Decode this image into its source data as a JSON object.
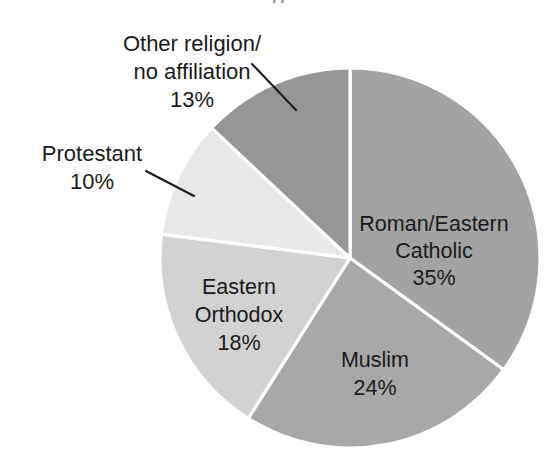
{
  "figure": {
    "background_color": "#ffffff",
    "cropped_title_fragment": "g",
    "center_x": 350,
    "center_y": 258,
    "radius": 190
  },
  "chart_data": {
    "type": "pie",
    "title": "",
    "xlabel": "",
    "ylabel": "",
    "units": "percent",
    "start_angle_deg": 0,
    "direction": "clockwise",
    "legend": "none",
    "grid": false,
    "categories": [
      "Roman/Eastern Catholic",
      "Muslim",
      "Eastern Orthodox",
      "Protestant",
      "Other religion/no affiliation"
    ],
    "values": [
      35,
      24,
      18,
      10,
      13
    ],
    "total": 100,
    "slices": [
      {
        "name": "Roman/Eastern Catholic",
        "label_line1": "Roman/Eastern",
        "label_line2": "Catholic",
        "value": 35,
        "value_text": "35%",
        "color": "#a3a3a3",
        "label_placement": "inside",
        "start_angle_deg": 0,
        "end_angle_deg": 126
      },
      {
        "name": "Muslim",
        "label_line1": "Muslim",
        "label_line2": "",
        "value": 24,
        "value_text": "24%",
        "color": "#a8a8a8",
        "label_placement": "inside",
        "start_angle_deg": 126,
        "end_angle_deg": 212.4
      },
      {
        "name": "Eastern Orthodox",
        "label_line1": "Eastern",
        "label_line2": "Orthodox",
        "value": 18,
        "value_text": "18%",
        "color": "#d2d2d2",
        "label_placement": "inside",
        "start_angle_deg": 212.4,
        "end_angle_deg": 277.2
      },
      {
        "name": "Protestant",
        "label_line1": "Protestant",
        "label_line2": "",
        "value": 10,
        "value_text": "10%",
        "color": "#e8e8e8",
        "label_placement": "outside-left",
        "start_angle_deg": 277.2,
        "end_angle_deg": 313.2
      },
      {
        "name": "Other religion/no affiliation",
        "label_line1": "Other religion/",
        "label_line2": "no affiliation",
        "value": 13,
        "value_text": "13%",
        "color": "#969696",
        "label_placement": "outside-top-left",
        "start_angle_deg": 313.2,
        "end_angle_deg": 360
      }
    ]
  },
  "labels": {
    "other_religion": {
      "line1": "Other religion/",
      "line2": "no affiliation",
      "percent": "13%"
    },
    "protestant": {
      "line1": "Protestant",
      "percent": "10%"
    },
    "catholic": {
      "line1": "Roman/Eastern",
      "line2": "Catholic",
      "percent": "35%"
    },
    "orthodox": {
      "line1": "Eastern",
      "line2": "Orthodox",
      "percent": "18%"
    },
    "muslim": {
      "line1": "Muslim",
      "percent": "24%"
    }
  }
}
